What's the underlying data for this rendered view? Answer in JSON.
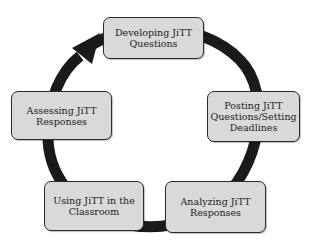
{
  "diagram": {
    "type": "cycle",
    "direction": "clockwise",
    "colors": {
      "background": "#ffffff",
      "box_fill": "#d9d9d9",
      "box_border": "#2a2a2a",
      "arrow": "#1a1a1a",
      "text": "#222222"
    },
    "steps": [
      {
        "id": "developing",
        "label": "Developing JiTT Questions"
      },
      {
        "id": "posting",
        "label": "Posting JiTT Questions/Setting Deadlines"
      },
      {
        "id": "analyzing",
        "label": "Analyzing JiTT Responses"
      },
      {
        "id": "using",
        "label": "Using JiTT in the Classroom"
      },
      {
        "id": "assessing",
        "label": "Assessing JiTT Responses"
      }
    ],
    "arrow_icon": "circular-arrow-icon"
  }
}
